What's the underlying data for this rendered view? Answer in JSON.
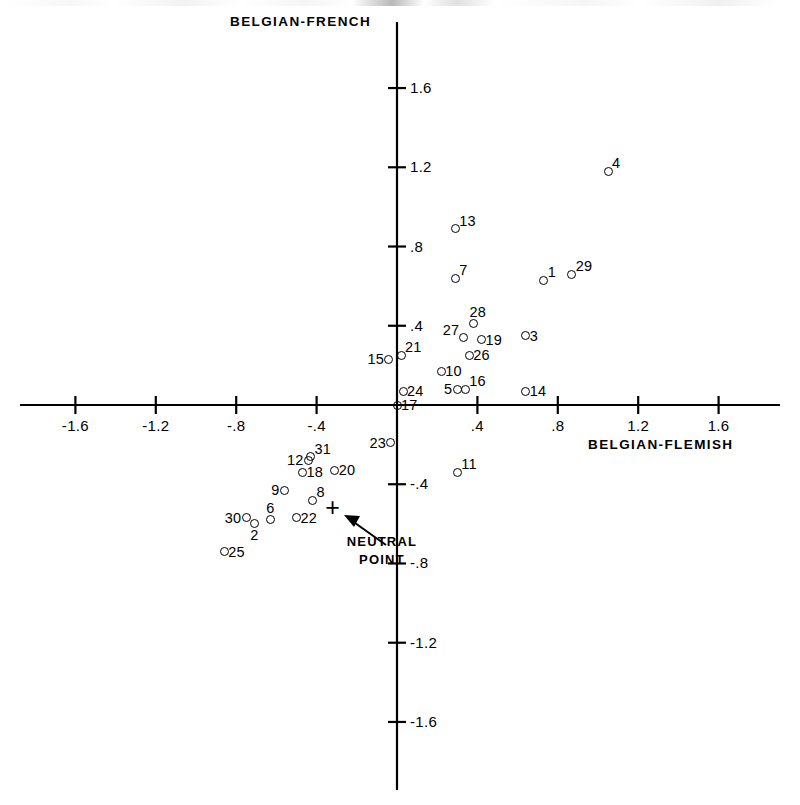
{
  "chart_data": {
    "type": "scatter",
    "title": "",
    "xlabel": "BELGIAN-FLEMISH",
    "ylabel": "BELGIAN-FRENCH",
    "xlim": [
      -1.85,
      1.85
    ],
    "ylim": [
      -1.85,
      1.85
    ],
    "grid": false,
    "legend": "none",
    "xticks": [
      "-1.6",
      "-1.2",
      "-.8",
      "-.4",
      ".4",
      ".8",
      "1.2",
      "1.6"
    ],
    "xtick_values": [
      -1.6,
      -1.2,
      -0.8,
      -0.4,
      0.4,
      0.8,
      1.2,
      1.6
    ],
    "yticks": [
      "1.6",
      "1.2",
      ".8",
      ".4",
      "-.4",
      "-.8",
      "-1.2",
      "-1.6"
    ],
    "ytick_values": [
      1.6,
      1.2,
      0.8,
      0.4,
      -0.4,
      -0.8,
      -1.2,
      -1.6
    ],
    "annotations": [
      {
        "name": "neutral-point",
        "label": "NEUTRAL\nPOINT",
        "marker": "+",
        "x": -0.32,
        "y": -0.52
      }
    ],
    "points": [
      {
        "label": "4",
        "x": 1.05,
        "y": 1.18,
        "lpos": "ne"
      },
      {
        "label": "13",
        "x": 0.29,
        "y": 0.89,
        "lpos": "ne"
      },
      {
        "label": "7",
        "x": 0.29,
        "y": 0.64,
        "lpos": "ne"
      },
      {
        "label": "1",
        "x": 0.73,
        "y": 0.63,
        "lpos": "ne"
      },
      {
        "label": "29",
        "x": 0.87,
        "y": 0.66,
        "lpos": "ne"
      },
      {
        "label": "28",
        "x": 0.38,
        "y": 0.41,
        "lpos": "n"
      },
      {
        "label": "27",
        "x": 0.33,
        "y": 0.34,
        "lpos": "nw"
      },
      {
        "label": "19",
        "x": 0.42,
        "y": 0.33,
        "lpos": "e"
      },
      {
        "label": "3",
        "x": 0.64,
        "y": 0.35,
        "lpos": "e"
      },
      {
        "label": "26",
        "x": 0.36,
        "y": 0.25,
        "lpos": "e"
      },
      {
        "label": "21",
        "x": 0.02,
        "y": 0.25,
        "lpos": "ne"
      },
      {
        "label": "15",
        "x": -0.04,
        "y": 0.23,
        "lpos": "w"
      },
      {
        "label": "10",
        "x": 0.22,
        "y": 0.17,
        "lpos": "e"
      },
      {
        "label": "24",
        "x": 0.03,
        "y": 0.07,
        "lpos": "e"
      },
      {
        "label": "5",
        "x": 0.3,
        "y": 0.08,
        "lpos": "w"
      },
      {
        "label": "16",
        "x": 0.34,
        "y": 0.08,
        "lpos": "ne"
      },
      {
        "label": "14",
        "x": 0.64,
        "y": 0.07,
        "lpos": "e"
      },
      {
        "label": "17",
        "x": 0.0,
        "y": 0.0,
        "lpos": "e"
      },
      {
        "label": "23",
        "x": -0.03,
        "y": -0.19,
        "lpos": "w"
      },
      {
        "label": "31",
        "x": -0.43,
        "y": -0.26,
        "lpos": "ne"
      },
      {
        "label": "12",
        "x": -0.44,
        "y": -0.28,
        "lpos": "w"
      },
      {
        "label": "18",
        "x": -0.47,
        "y": -0.34,
        "lpos": "e"
      },
      {
        "label": "20",
        "x": -0.31,
        "y": -0.33,
        "lpos": "e"
      },
      {
        "label": "11",
        "x": 0.3,
        "y": -0.34,
        "lpos": "ne"
      },
      {
        "label": "9",
        "x": -0.56,
        "y": -0.43,
        "lpos": "w"
      },
      {
        "label": "8",
        "x": -0.42,
        "y": -0.48,
        "lpos": "ne"
      },
      {
        "label": "22",
        "x": -0.5,
        "y": -0.57,
        "lpos": "e"
      },
      {
        "label": "6",
        "x": -0.63,
        "y": -0.58,
        "lpos": "n"
      },
      {
        "label": "30",
        "x": -0.75,
        "y": -0.57,
        "lpos": "w"
      },
      {
        "label": "2",
        "x": -0.71,
        "y": -0.6,
        "lpos": "s"
      },
      {
        "label": "25",
        "x": -0.86,
        "y": -0.74,
        "lpos": "e"
      }
    ]
  }
}
